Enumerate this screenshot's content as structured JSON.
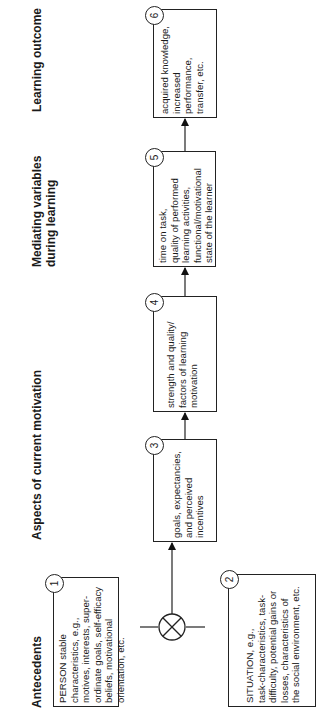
{
  "headers": {
    "antecedents": "Antecedents",
    "current_motivation": "Aspects of current motivation",
    "mediating_line1": "Mediating variables",
    "mediating_line2": "during learning",
    "outcome": "Learning outcome"
  },
  "boxes": [
    {
      "num": "1",
      "text": "PERSON stable\ncharacteristics, e.g.,\nmotives, interests, super-\nordinate goals, self-efficacy\nbeliefs, motivational\norientation, etc."
    },
    {
      "num": "2",
      "text": "SITUATION, e.g.,\ntask-characteristics, task-\ndifficulty, potential gains or\nlosses, characteristics of\nthe social environment, etc."
    },
    {
      "num": "3",
      "text": "goals, expectancies,\nand perceived incentives"
    },
    {
      "num": "4",
      "text": "strength and quality/\nfactors of learning\nmotivation"
    },
    {
      "num": "5",
      "text": "time on task,\nquality of performed\nlearning activities,\nfunctional/motivational\nstate of the learner"
    },
    {
      "num": "6",
      "text": "acquired knowledge,\nincreased performance,\ntransfer, etc."
    }
  ],
  "operator": {
    "symbol": "interaction-operator (circled X)"
  },
  "orientation": "diagram rotated 90° counter-clockwise"
}
